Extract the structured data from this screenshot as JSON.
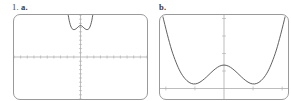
{
  "worksheet": {
    "problems": [
      {
        "number": "1.",
        "letter": "a.",
        "label": "1. a."
      },
      {
        "number": "",
        "letter": "b.",
        "label": "b."
      }
    ]
  },
  "labels": {
    "problem_1a_number": "1.",
    "problem_1a_letter": "a.",
    "problem_1b_letter": "b."
  },
  "chart_data": [
    {
      "id": "graph-a",
      "type": "line",
      "title": "",
      "xlabel": "",
      "ylabel": "",
      "xlim": [
        -10,
        10
      ],
      "ylim": [
        -10,
        10
      ],
      "grid": false,
      "axes": {
        "x_axis_at_y": 0,
        "y_axis_at_x": 0,
        "tick_spacing_x": 1,
        "tick_spacing_y": 1
      },
      "description": "Quartic with W shape compressed near top of standard viewing window",
      "series": [
        {
          "name": "y = f(x)",
          "x": [
            -1.85,
            -1.7,
            -1.55,
            -1.4,
            -1.25,
            -1.1,
            -0.95,
            -0.8,
            -0.65,
            -0.5,
            -0.35,
            -0.2,
            -0.05,
            0.0,
            0.05,
            0.2,
            0.35,
            0.5,
            0.65,
            0.8,
            0.95,
            1.1,
            1.25,
            1.4,
            1.55,
            1.7,
            1.85
          ],
          "y": [
            10.0,
            8.7,
            7.75,
            7.1,
            6.72,
            6.55,
            6.52,
            6.6,
            6.75,
            6.95,
            7.18,
            7.38,
            7.48,
            7.5,
            7.48,
            7.38,
            7.18,
            6.95,
            6.75,
            6.6,
            6.52,
            6.55,
            6.72,
            7.1,
            7.75,
            8.7,
            10.0
          ]
        }
      ]
    },
    {
      "id": "graph-b",
      "type": "line",
      "title": "",
      "xlabel": "",
      "ylabel": "",
      "xlim": [
        -2.2,
        2.2
      ],
      "ylim": [
        -0.6,
        4.2
      ],
      "grid": false,
      "axes": {
        "x_axis_at_y": 0,
        "y_axis_at_x": 0,
        "tick_spacing_x": 1,
        "tick_spacing_y": 1
      },
      "description": "Zoomed quartic showing two minima and a local maximum at the y-axis",
      "series": [
        {
          "name": "y = f(x)",
          "x": [
            -2.1,
            -1.95,
            -1.8,
            -1.65,
            -1.5,
            -1.35,
            -1.2,
            -1.05,
            -0.9,
            -0.75,
            -0.6,
            -0.45,
            -0.3,
            -0.15,
            0.0,
            0.15,
            0.3,
            0.45,
            0.6,
            0.75,
            0.9,
            1.05,
            1.2,
            1.35,
            1.5,
            1.65,
            1.8,
            1.95,
            2.1
          ],
          "y": [
            4.1,
            3.1,
            2.2,
            1.5,
            0.95,
            0.58,
            0.35,
            0.26,
            0.3,
            0.45,
            0.66,
            0.9,
            1.12,
            1.28,
            1.34,
            1.28,
            1.12,
            0.9,
            0.66,
            0.45,
            0.3,
            0.26,
            0.35,
            0.58,
            0.95,
            1.5,
            2.2,
            3.1,
            4.1
          ]
        }
      ]
    }
  ]
}
